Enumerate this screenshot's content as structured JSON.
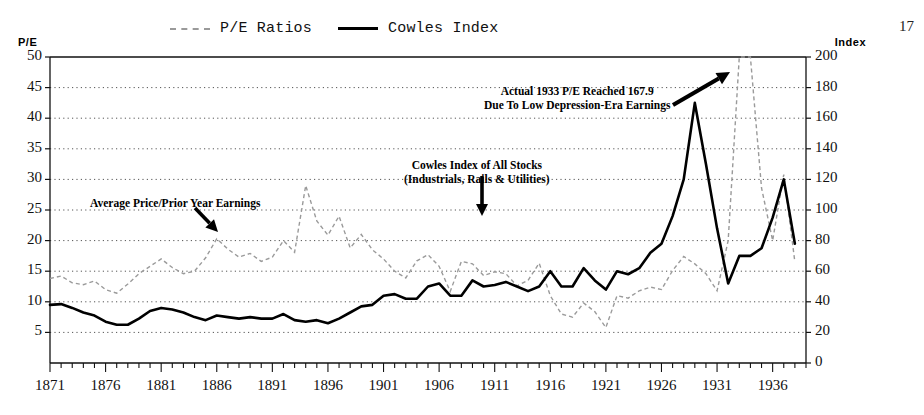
{
  "page": {
    "number": "17"
  },
  "legend": {
    "position": "top-center",
    "entries": [
      {
        "label": "P/E Ratios",
        "style": "dashed",
        "color": "#9a9a9a"
      },
      {
        "label": "Cowles Index",
        "style": "solid",
        "color": "#000000"
      }
    ]
  },
  "axes": {
    "left_title": "P/E",
    "right_title": "Index",
    "left_ticks": [
      "50",
      "45",
      "40",
      "35",
      "30",
      "25",
      "20",
      "15",
      "10",
      "5"
    ],
    "right_ticks": [
      "200",
      "180",
      "160",
      "140",
      "120",
      "100",
      "80",
      "60",
      "40",
      "20",
      "0"
    ],
    "x_ticks": [
      "1871",
      "1876",
      "1881",
      "1886",
      "1891",
      "1896",
      "1901",
      "1906",
      "1911",
      "1916",
      "1921",
      "1926",
      "1931",
      "1936"
    ]
  },
  "annotations": [
    {
      "name": "pe-1933-note",
      "lines": [
        "Actual 1933 P/E Reached 167.9",
        "Due To Low Depression-Era Earnings"
      ]
    },
    {
      "name": "cowles-index-note",
      "lines": [
        "Cowles Index of All Stocks",
        "(Industrials, Rails & Utilities)"
      ]
    },
    {
      "name": "average-price-note",
      "lines": [
        "Average Price/Prior Year Earnings"
      ]
    }
  ],
  "chart_data": {
    "type": "line",
    "title": "",
    "subtitle": "",
    "xlabel": "",
    "ylabel": "P/E",
    "y2label": "Index",
    "xlim": [
      1871,
      1939
    ],
    "ylim": [
      0,
      50
    ],
    "y2lim": [
      0,
      200
    ],
    "grid": "horizontal-dotted",
    "legend_position": "top-center",
    "x": [
      1871,
      1872,
      1873,
      1874,
      1875,
      1876,
      1877,
      1878,
      1879,
      1880,
      1881,
      1882,
      1883,
      1884,
      1885,
      1886,
      1887,
      1888,
      1889,
      1890,
      1891,
      1892,
      1893,
      1894,
      1895,
      1896,
      1897,
      1898,
      1899,
      1900,
      1901,
      1902,
      1903,
      1904,
      1905,
      1906,
      1907,
      1908,
      1909,
      1910,
      1911,
      1912,
      1913,
      1914,
      1915,
      1916,
      1917,
      1918,
      1919,
      1920,
      1921,
      1922,
      1923,
      1924,
      1925,
      1926,
      1927,
      1928,
      1929,
      1930,
      1931,
      1932,
      1933,
      1934,
      1935,
      1936,
      1937,
      1938
    ],
    "series": [
      {
        "name": "P/E Ratios",
        "axis": "left",
        "style": "dashed",
        "color": "#9a9a9a",
        "units": "ratio",
        "values": [
          13.8,
          14.2,
          13.1,
          12.8,
          13.4,
          12.0,
          11.4,
          12.9,
          14.6,
          15.8,
          17.0,
          15.6,
          14.6,
          15.0,
          17.2,
          20.3,
          18.6,
          17.3,
          17.9,
          16.6,
          17.3,
          20.0,
          18.1,
          29.0,
          23.2,
          20.9,
          24.0,
          18.8,
          21.0,
          18.5,
          17.0,
          15.0,
          13.9,
          16.7,
          17.7,
          15.8,
          11.7,
          16.6,
          16.2,
          14.3,
          14.9,
          14.6,
          12.6,
          13.5,
          16.3,
          11.0,
          8.0,
          7.5,
          9.8,
          8.4,
          5.8,
          11.0,
          10.6,
          11.8,
          12.4,
          12.0,
          15.1,
          17.4,
          16.2,
          14.6,
          11.8,
          20.0,
          50.0,
          50.0,
          28.6,
          20.0,
          30.8,
          16.5
        ],
        "note": "Spike clipped at top of 50 scale circa 1932-1934; actual 1933 P/E reached 167.9"
      },
      {
        "name": "Cowles Index",
        "axis": "right",
        "style": "solid",
        "color": "#000000",
        "units": "index",
        "values": [
          38,
          38.5,
          36,
          33,
          31,
          27,
          25,
          25,
          29,
          34,
          36,
          35,
          33,
          30,
          28,
          31,
          30,
          29,
          30,
          29,
          29,
          32,
          28,
          27,
          28,
          26,
          29,
          33,
          37,
          38,
          44,
          45,
          42,
          42,
          50,
          52,
          44,
          44,
          54,
          50,
          51,
          53,
          50,
          47,
          50,
          60,
          50,
          50,
          62,
          54,
          48,
          60,
          58,
          62,
          72,
          78,
          96,
          120,
          170,
          130,
          88,
          52,
          70,
          70,
          75,
          95,
          120,
          78
        ]
      }
    ]
  }
}
